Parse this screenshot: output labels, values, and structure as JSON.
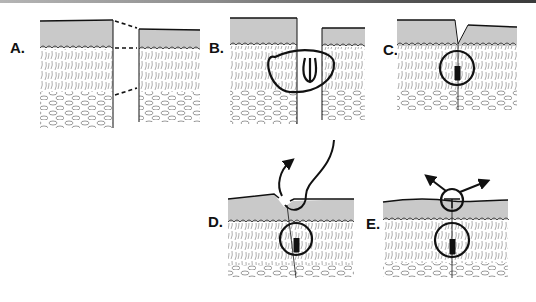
{
  "figure": {
    "colors": {
      "epidermis": "#c9c9c9",
      "ink": "#111111",
      "hatch": "#666666",
      "background": "#ffffff"
    },
    "panels": [
      {
        "id": "A",
        "label": "A."
      },
      {
        "id": "B",
        "label": "B."
      },
      {
        "id": "C",
        "label": "C."
      },
      {
        "id": "D",
        "label": "D."
      },
      {
        "id": "E",
        "label": "E."
      }
    ]
  }
}
